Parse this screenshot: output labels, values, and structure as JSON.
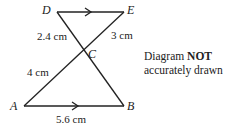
{
  "diagram": {
    "points": {
      "D": "D",
      "E": "E",
      "C": "C",
      "A": "A",
      "B": "B"
    },
    "lengths": {
      "DC": "2.4 cm",
      "EC": "3 cm",
      "AC": "4 cm",
      "AB": "5.6 cm"
    },
    "note": {
      "line1_prefix": "Diagram ",
      "line1_bold": "NOT",
      "line2": "accurately drawn"
    },
    "line_color": "#222222"
  }
}
